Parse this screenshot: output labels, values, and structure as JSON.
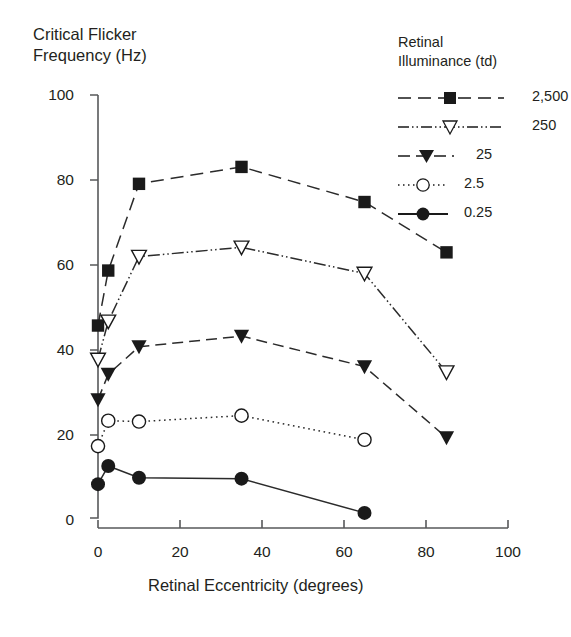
{
  "chart_data": {
    "type": "line",
    "title": "",
    "ylabel": "Critical Flicker\nFrequency (Hz)",
    "xlabel": "Retinal Eccentricity (degrees)",
    "xlim": [
      0,
      100
    ],
    "ylim": [
      0,
      100
    ],
    "xticks": [
      0,
      20,
      40,
      60,
      80,
      100
    ],
    "yticks": [
      0,
      20,
      40,
      60,
      80,
      100
    ],
    "xtick_labels": [
      "0",
      "20",
      "40",
      "60",
      "80",
      "100"
    ],
    "ytick_labels": [
      "0",
      "20",
      "40",
      "60",
      "80",
      "100"
    ],
    "grid": false,
    "legend_position": "top-right",
    "legend_title": "Retinal\nIlluminance (td)",
    "series": [
      {
        "name": "2,500",
        "marker": "filled-square",
        "linestyle": "dashed",
        "color": "#1a1a1a",
        "x": [
          0,
          2.5,
          10,
          35,
          65,
          85
        ],
        "values": [
          45.5,
          58.5,
          79,
          83,
          74.7,
          62.8
        ]
      },
      {
        "name": "250",
        "marker": "open-triangle-down",
        "linestyle": "dash-dot-dot",
        "color": "#1a1a1a",
        "x": [
          0,
          2.5,
          10,
          35,
          65,
          85
        ],
        "values": [
          37.5,
          46.5,
          61.8,
          64,
          57.8,
          34.5
        ]
      },
      {
        "name": "25",
        "marker": "filled-triangle-down",
        "linestyle": "dashed-short",
        "color": "#1a1a1a",
        "x": [
          0,
          2.5,
          10,
          35,
          65,
          85
        ],
        "values": [
          28,
          34,
          40.5,
          43,
          35.8,
          19
        ]
      },
      {
        "name": "2.5",
        "marker": "open-circle",
        "linestyle": "dotted",
        "color": "#1a1a1a",
        "x": [
          0,
          2.5,
          10,
          35,
          65
        ],
        "values": [
          17,
          23,
          22.8,
          24.2,
          18.5
        ]
      },
      {
        "name": "0.25",
        "marker": "filled-circle",
        "linestyle": "solid",
        "color": "#1a1a1a",
        "x": [
          0,
          2.5,
          10,
          35,
          65
        ],
        "values": [
          8,
          12.3,
          9.5,
          9.3,
          1.2
        ]
      }
    ]
  }
}
